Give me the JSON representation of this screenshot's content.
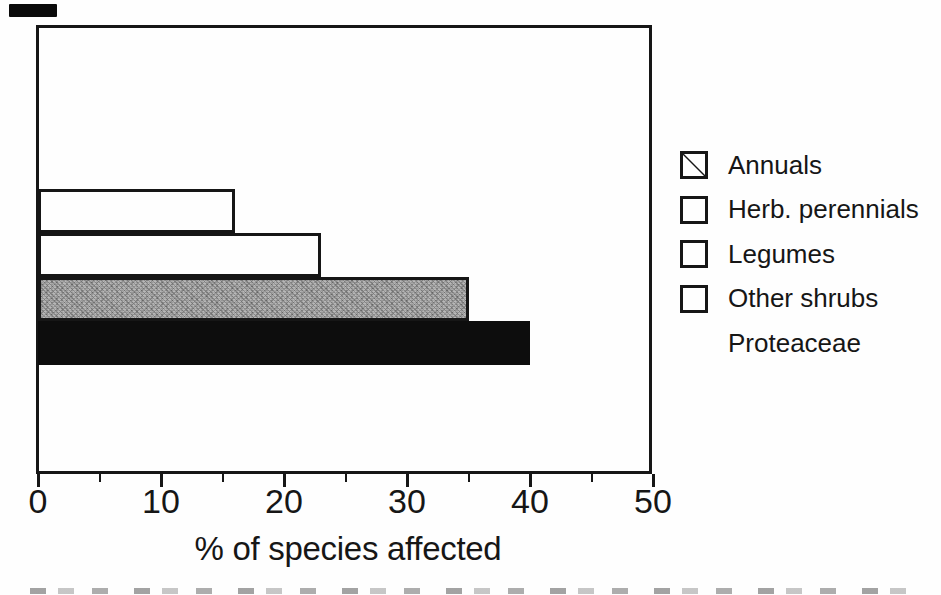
{
  "figure": {
    "background": "#fefefe",
    "ink_color": "#161616"
  },
  "chart_data": {
    "type": "bar",
    "orientation": "horizontal",
    "title": "",
    "xlabel": "% of species affected",
    "ylabel": "",
    "xlim": [
      0,
      50
    ],
    "xticks": [
      0,
      10,
      20,
      30,
      40,
      50
    ],
    "xticks_minor": [
      5,
      15,
      25,
      35,
      45
    ],
    "x_tick_labels": [
      "0",
      "10",
      "20",
      "30",
      "40",
      "50"
    ],
    "grid": false,
    "legend_position": "right",
    "categories": [
      "Annuals",
      "Herb. perennials",
      "Legumes",
      "Other shrubs",
      "Proteaceae"
    ],
    "values": [
      0,
      16,
      23,
      35,
      40
    ],
    "series": [
      {
        "name": "Annuals",
        "value": 0,
        "fill": "white-diagonal"
      },
      {
        "name": "Herb. perennials",
        "value": 16,
        "fill": "white"
      },
      {
        "name": "Legumes",
        "value": 23,
        "fill": "white"
      },
      {
        "name": "Other shrubs",
        "value": 35,
        "fill": "stipple-gray"
      },
      {
        "name": "Proteaceae",
        "value": 40,
        "fill": "black"
      }
    ],
    "colors": {
      "outline": "#161616",
      "white_fill": "#fefefe",
      "stipple_gray_fill": "#a8a8a8",
      "black_fill": "#0d0d0d"
    }
  }
}
